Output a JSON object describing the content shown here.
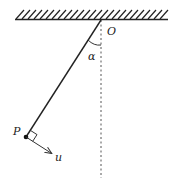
{
  "diagram": {
    "type": "pendulum",
    "labels": {
      "pivot": "O",
      "angle": "α",
      "bob": "P",
      "velocity": "u"
    },
    "colors": {
      "stroke": "#222222",
      "dashed": "#555555",
      "background": "#ffffff"
    }
  }
}
